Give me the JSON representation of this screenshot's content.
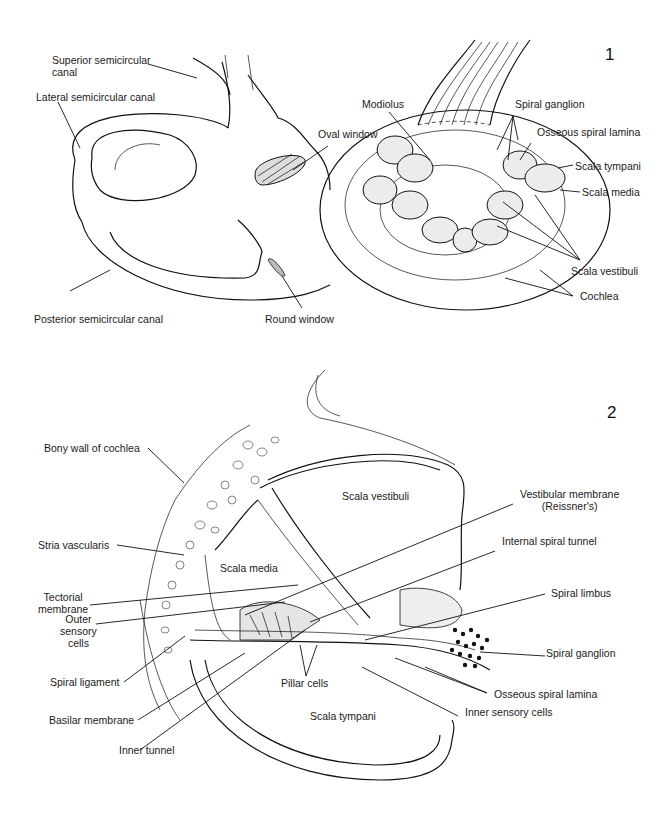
{
  "figures": [
    {
      "number": "1",
      "labels": {
        "superior_semicircular_canal": [
          "Superior semicircular",
          "canal"
        ],
        "lateral_semicircular_canal": "Lateral semicircular canal",
        "oval_window": "Oval window",
        "modiolus": "Modiolus",
        "spiral_ganglion": "Spiral ganglion",
        "osseous_spiral_lamina": "Osseous spiral lamina",
        "scala_tympani": "Scala tympani",
        "scala_media": "Scala media",
        "scala_vestibuli": "Scala vestibuli",
        "cochlea": "Cochlea",
        "posterior_semicircular_canal": "Posterior semicircular canal",
        "round_window": "Round window"
      }
    },
    {
      "number": "2",
      "labels": {
        "bony_wall": "Bony wall of cochlea",
        "scala_vestibuli": "Scala vestibuli",
        "vestibular_membrane": [
          "Vestibular membrane",
          "(Reissner's)"
        ],
        "stria_vascularis": "Stria vascularis",
        "scala_media": "Scala media",
        "internal_spiral_tunnel": "Internal spiral tunnel",
        "tectorial_membrane": [
          "Tectorial",
          "membrane"
        ],
        "spiral_limbus": "Spiral limbus",
        "outer_sensory_cells": [
          "Outer",
          "sensory",
          "cells"
        ],
        "spiral_ganglion": "Spiral ganglion",
        "spiral_ligament": "Spiral ligament",
        "pillar_cells": "Pillar cells",
        "osseous_spiral_lamina": "Osseous spiral lamina",
        "basilar_membrane": "Basilar membrane",
        "scala_tympani": "Scala tympani",
        "inner_sensory_cells": "Inner sensory cells",
        "inner_tunnel": "Inner tunnel"
      }
    }
  ]
}
